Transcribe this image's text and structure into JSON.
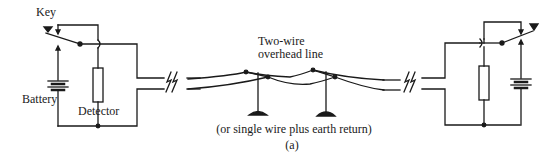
{
  "diagram": {
    "type": "telegraph circuit schematic",
    "caption": "(a)",
    "labels": {
      "key": "Key",
      "battery": "Battery",
      "detector": "Detector",
      "line_title_1": "Two-wire",
      "line_title_2": "overhead line",
      "note": "(or single wire plus earth return)"
    },
    "nodes": [
      {
        "id": "left-station",
        "components": [
          "Key",
          "Battery",
          "Detector"
        ]
      },
      {
        "id": "overhead-line",
        "components": [
          "Two-wire overhead line",
          "pole",
          "pole"
        ]
      },
      {
        "id": "right-station",
        "components": [
          "Key",
          "Battery",
          "Detector"
        ]
      }
    ],
    "edges": [
      {
        "from": "left-station",
        "to": "overhead-line",
        "style": "broken (//)"
      },
      {
        "from": "overhead-line",
        "to": "right-station",
        "style": "broken (//)"
      }
    ],
    "stroke_color": "#1a1a1a",
    "background": "#ffffff"
  }
}
